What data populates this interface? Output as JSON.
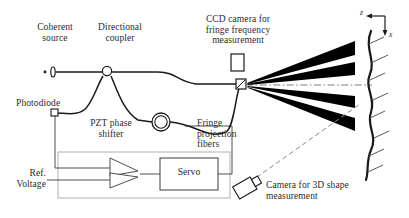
{
  "figure": {
    "type": "optical-setup-schematic"
  },
  "labels": {
    "coherent_source": "Coherent\nsource",
    "directional_coupler": "Directional\ncoupler",
    "ccd_camera": "CCD camera for\nfringe frequency\nmeasurement",
    "photodiode": "Photodiode",
    "pzt_phase_shifter": "PZT phase\nshifter",
    "fringe_projection_fibers": "Fringe\nprojection\nfibers",
    "ref_voltage": "Ref.\nVoltage",
    "servo": "Servo",
    "camera_3d": "Camera for 3D shape\nmeasurement"
  },
  "axes": {
    "z_label": "z",
    "x_label": "x"
  },
  "components": {
    "source_icon": "laser-source-icon",
    "coupler_icon": "directional-coupler-icon",
    "photodiode_icon": "photodiode-icon",
    "pzt_icon": "pzt-ring-icon",
    "ccd_icon": "ccd-camera-icon",
    "camera3d_icon": "camera-3d-icon",
    "fiber_output_icon": "fiber-array-output-icon",
    "amplifier_icon": "differential-amplifier-icon",
    "servo_box_icon": "servo-box-icon",
    "target_surface_icon": "wavy-target-surface-icon"
  },
  "colors": {
    "ink": "#1a1a1a",
    "text": "#2b2b2b",
    "loop_border": "#9a9a9a",
    "beam": "#000000",
    "background": "#ffffff"
  },
  "beams": {
    "count": 4,
    "description": "four diverging fringe projection beams"
  }
}
